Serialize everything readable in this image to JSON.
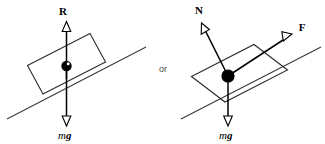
{
  "figure": {
    "conjunction": "or",
    "colors": {
      "stroke": "#000000",
      "incline": "#3a3a3a",
      "block": "#2c2c2c",
      "arrow_fill": "#ffffff",
      "dot": "#000000",
      "background": "#ffffff"
    },
    "diagrams": [
      {
        "name": "left-diagram",
        "incline_angle_deg": 27,
        "vectors": [
          {
            "name": "normal-reaction",
            "label": "R",
            "direction": "up",
            "style": "hollow-arrowhead"
          },
          {
            "name": "weight",
            "label_italic": "m",
            "label_bold_italic": "g",
            "direction": "down",
            "style": "hollow-arrowhead"
          }
        ],
        "center_marker": "filled-circle-with-highlight"
      },
      {
        "name": "right-diagram",
        "incline_angle_deg": 27,
        "vectors": [
          {
            "name": "normal-force",
            "label": "N",
            "direction": "up-left-perpendicular",
            "style": "hollow-arrowhead"
          },
          {
            "name": "friction-force",
            "label": "F",
            "direction": "up-slope",
            "style": "hollow-arrowhead"
          },
          {
            "name": "weight",
            "label_italic": "m",
            "label_bold_italic": "g",
            "direction": "down",
            "style": "hollow-arrowhead"
          }
        ],
        "center_marker": "filled-circle"
      }
    ]
  }
}
